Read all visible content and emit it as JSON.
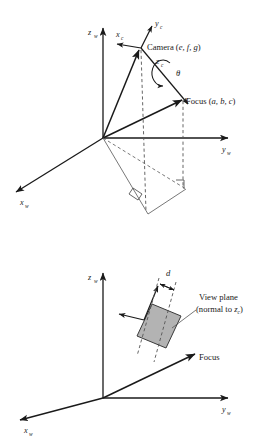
{
  "figure": {
    "background_color": "#ffffff",
    "line_color": "#1a1a1a",
    "plane_fill_color": "#b3b3b3",
    "panels": [
      {
        "id": "top",
        "name": "camera-focus-panel",
        "axes": [
          {
            "name": "z-world-axis",
            "label": "z",
            "subscript": "w"
          },
          {
            "name": "y-world-axis",
            "label": "y",
            "subscript": "w"
          },
          {
            "name": "x-world-axis",
            "label": "x",
            "subscript": "w"
          }
        ],
        "camera_axes": [
          {
            "name": "x-camera-axis",
            "label": "x",
            "subscript": "c"
          },
          {
            "name": "y-camera-axis",
            "label": "y",
            "subscript": "c"
          },
          {
            "name": "z-camera-axis",
            "label": "z",
            "subscript": "c"
          }
        ],
        "annotations": [
          {
            "name": "camera-label",
            "text": "Camera (",
            "coords": "e, f, g",
            "close": ")"
          },
          {
            "name": "focus-label",
            "text": "Focus (",
            "coords": "a, b, c",
            "close": ")"
          },
          {
            "name": "theta-label",
            "text": "θ"
          }
        ]
      },
      {
        "id": "bottom",
        "name": "view-plane-panel",
        "axes": [
          {
            "name": "z-world-axis",
            "label": "z",
            "subscript": "w"
          },
          {
            "name": "y-world-axis",
            "label": "y",
            "subscript": "w"
          },
          {
            "name": "x-world-axis",
            "label": "x",
            "subscript": "w"
          }
        ],
        "annotations": [
          {
            "name": "distance-label",
            "text": "d"
          },
          {
            "name": "view-plane-label-line1",
            "text": "View plane"
          },
          {
            "name": "view-plane-label-line2-prefix",
            "text": "(normal to "
          },
          {
            "name": "view-plane-label-line2-axis",
            "text": "z"
          },
          {
            "name": "view-plane-label-line2-sub",
            "text": "c"
          },
          {
            "name": "view-plane-label-line2-close",
            "text": ")"
          },
          {
            "name": "focus-label",
            "text": "Focus"
          }
        ]
      }
    ]
  }
}
